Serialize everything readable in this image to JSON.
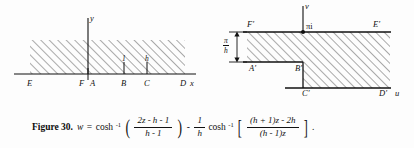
{
  "figure": {
    "number_label": "Figure 30.",
    "caption_formula_plain": "w = cosh^-1((2z - h - 1)/(h - 1)) - (1/h) cosh^-1[((h + 1)z - 2h)/((h - 1)z)].",
    "formula": {
      "lhs": "w",
      "equals": "=",
      "term1_fn": "cosh",
      "term1_sup": "-1",
      "term1_numerator": "2z - h - 1",
      "term1_denominator": "h - 1",
      "minus": "-",
      "coef_numerator": "1",
      "coef_denominator": "h",
      "term2_fn": "cosh",
      "term2_sup": "-1",
      "term2_numerator": "(h + 1)z - 2h",
      "term2_denominator": "(h - 1)z",
      "paren_open": "(",
      "paren_close": ")",
      "bracket_open": "[",
      "bracket_close": "]",
      "end_period": "."
    }
  },
  "left_diagram": {
    "name": "z-plane",
    "axis_vertical_label": "y",
    "axis_horizontal_label": "x",
    "points": [
      {
        "id": "E",
        "label": "E"
      },
      {
        "id": "F",
        "label": "F"
      },
      {
        "id": "A",
        "label": "A"
      },
      {
        "id": "B",
        "label": "B"
      },
      {
        "id": "C",
        "label": "C"
      },
      {
        "id": "D",
        "label": "D"
      }
    ],
    "segment_labels": [
      {
        "id": "one",
        "label": "1"
      },
      {
        "id": "h",
        "label": "h"
      }
    ],
    "hatch_color": "#8d8d8d",
    "line_color": "#111111"
  },
  "right_diagram": {
    "name": "w-plane",
    "axis_vertical_label": "v",
    "axis_horizontal_label": "u",
    "top_marker_label": "πi",
    "height_label": {
      "numerator": "π",
      "denominator": "h"
    },
    "points": [
      {
        "id": "Fp",
        "label": "F′"
      },
      {
        "id": "Ep",
        "label": "E′"
      },
      {
        "id": "Ap",
        "label": "A′"
      },
      {
        "id": "Bp",
        "label": "B′"
      },
      {
        "id": "Cp",
        "label": "C′"
      },
      {
        "id": "Dp",
        "label": "D′"
      }
    ],
    "hatch_color": "#8d8d8d",
    "line_color": "#111111"
  }
}
